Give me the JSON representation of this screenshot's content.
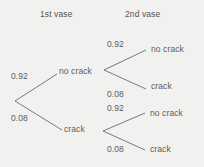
{
  "diagram": {
    "type": "probability-tree",
    "title": "",
    "colors": {
      "background": "#f1f1ef",
      "line": "#6b6b6b",
      "text": "#5a5a5a"
    },
    "columns": [
      {
        "label": "1st vase"
      },
      {
        "label": "2nd vase"
      }
    ],
    "stage1": {
      "branches": [
        {
          "probability": "0.92",
          "outcome": "no crack"
        },
        {
          "probability": "0.08",
          "outcome": "crack"
        }
      ]
    },
    "stage2_upper": {
      "parent": "no crack",
      "branches": [
        {
          "probability": "0.92",
          "outcome": "no crack"
        },
        {
          "probability": "0.08",
          "outcome": "crack"
        }
      ]
    },
    "stage2_lower": {
      "parent": "crack",
      "branches": [
        {
          "probability": "0.92",
          "outcome": "no crack"
        },
        {
          "probability": "0.08",
          "outcome": "crack"
        }
      ]
    }
  }
}
